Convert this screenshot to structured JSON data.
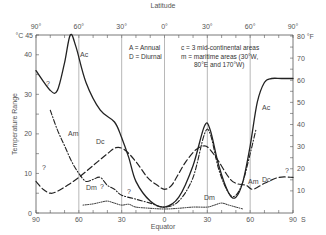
{
  "chart_data": {
    "type": "line",
    "title": "",
    "top_axis": {
      "label": "Latitude",
      "ticks": [
        "90°",
        "60°",
        "30°",
        "0°",
        "30°",
        "60°",
        "90°"
      ]
    },
    "bottom_axis": {
      "label": "Equator",
      "ticks": [
        "90",
        "60",
        "30",
        "0",
        "30",
        "60",
        "90"
      ],
      "end_label": "S"
    },
    "left_axis": {
      "label": "Temperature Range",
      "unit": "°C",
      "ticks": [
        "0",
        "10",
        "20",
        "30",
        "40",
        "45"
      ],
      "ylim": [
        0,
        45
      ]
    },
    "right_axis": {
      "unit": "°F",
      "ticks": [
        "10",
        "20",
        "30",
        "40",
        "50",
        "60",
        "70",
        "80"
      ],
      "ylim": [
        0,
        81
      ]
    },
    "legend": {
      "A": "Annual",
      "D": "Diurnal",
      "c": "3 mid-continental areas",
      "m": "maritime areas (30°W, 80°E and 170°W)",
      "lines": [
        "A = Annual",
        "D = Diurnal",
        "c = 3 mid-continental areas",
        "m = maritime areas (30°W,",
        "80°E and 170°W)"
      ]
    },
    "x_latitudes": [
      90,
      75,
      65,
      60,
      50,
      40,
      30,
      20,
      10,
      0,
      -10,
      -20,
      -30,
      -40,
      -50,
      -60,
      -70,
      -80,
      -90
    ],
    "series": [
      {
        "name": "Ac",
        "label": "Ac",
        "style": "solid",
        "points": [
          [
            90,
            36
          ],
          [
            80,
            31
          ],
          [
            75,
            31
          ],
          [
            70,
            38
          ],
          [
            66,
            45
          ],
          [
            62,
            42
          ],
          [
            55,
            33
          ],
          [
            45,
            26
          ],
          [
            35,
            23
          ],
          [
            30,
            19
          ],
          [
            25,
            14
          ],
          [
            20,
            8
          ],
          [
            10,
            3
          ],
          [
            0,
            1.5
          ],
          [
            -10,
            4
          ],
          [
            -20,
            12
          ],
          [
            -28,
            22
          ],
          [
            -32,
            21
          ],
          [
            -38,
            12
          ],
          [
            -45,
            5
          ],
          [
            -50,
            4
          ],
          [
            -55,
            8
          ],
          [
            -60,
            17
          ],
          [
            -65,
            28
          ],
          [
            -70,
            33
          ],
          [
            -75,
            34
          ],
          [
            -82,
            34
          ],
          [
            -90,
            34
          ]
        ]
      },
      {
        "name": "Am",
        "label": "Am",
        "style": "dash-dot",
        "points": [
          [
            80,
            26
          ],
          [
            75,
            21
          ],
          [
            70,
            17
          ],
          [
            65,
            13
          ],
          [
            60,
            10
          ],
          [
            55,
            8
          ],
          [
            50,
            8.5
          ],
          [
            45,
            9
          ],
          [
            40,
            7
          ],
          [
            35,
            6
          ],
          [
            30,
            4.5
          ],
          [
            20,
            3.5
          ],
          [
            10,
            2.5
          ],
          [
            0,
            1.5
          ],
          [
            -10,
            3
          ],
          [
            -20,
            9
          ],
          [
            -28,
            20
          ],
          [
            -32,
            20
          ],
          [
            -38,
            11
          ],
          [
            -45,
            5
          ],
          [
            -50,
            4.5
          ],
          [
            -55,
            8
          ],
          [
            -60,
            15
          ],
          [
            -64,
            21
          ]
        ]
      },
      {
        "name": "Dc",
        "label": "Dc",
        "style": "long-dash",
        "points": [
          [
            90,
            8
          ],
          [
            85,
            6
          ],
          [
            80,
            5
          ],
          [
            75,
            5.5
          ],
          [
            68,
            7
          ],
          [
            60,
            9
          ],
          [
            50,
            12
          ],
          [
            40,
            15
          ],
          [
            34,
            16.5
          ],
          [
            28,
            16
          ],
          [
            20,
            13
          ],
          [
            12,
            9
          ],
          [
            5,
            7
          ],
          [
            0,
            6
          ],
          [
            -5,
            7
          ],
          [
            -10,
            10
          ],
          [
            -15,
            13
          ],
          [
            -22,
            16
          ],
          [
            -28,
            17
          ],
          [
            -32,
            16
          ],
          [
            -38,
            13
          ],
          [
            -45,
            9
          ],
          [
            -50,
            7.5
          ],
          [
            -57,
            7
          ],
          [
            -62,
            6
          ],
          [
            -70,
            7.5
          ],
          [
            -80,
            9
          ],
          [
            -90,
            9
          ]
        ]
      },
      {
        "name": "Dm",
        "label": "Dm",
        "style": "dotted",
        "points": [
          [
            57,
            2
          ],
          [
            50,
            2.3
          ],
          [
            45,
            2.7
          ],
          [
            40,
            3
          ],
          [
            35,
            2.5
          ],
          [
            30,
            2
          ],
          [
            25,
            2.2
          ],
          [
            20,
            1.5
          ],
          [
            10,
            1.2
          ],
          [
            0,
            1
          ],
          [
            -10,
            1.2
          ],
          [
            -20,
            1.5
          ],
          [
            -30,
            1.5
          ],
          [
            -35,
            2
          ],
          [
            -40,
            2.5
          ],
          [
            -45,
            2
          ],
          [
            -50,
            1.5
          ],
          [
            -55,
            1
          ]
        ]
      }
    ],
    "annotations": [
      "?",
      "?",
      "?",
      "?",
      "?"
    ],
    "vertical_gridlines_at": [
      60,
      30,
      0,
      -30,
      -60
    ],
    "grid": false
  }
}
